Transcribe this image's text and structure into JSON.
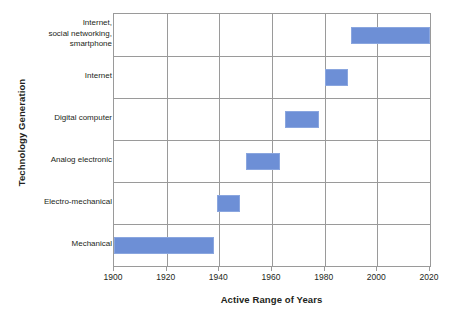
{
  "chart_data": {
    "type": "bar",
    "orientation": "horizontal",
    "subtype": "range-bar",
    "title": "",
    "xlabel": "Active Range of Years",
    "ylabel": "Technology Generation",
    "xlim": [
      1900,
      2020
    ],
    "xticks": [
      1900,
      1920,
      1940,
      1960,
      1980,
      2000,
      2020
    ],
    "xtick_labels": [
      "1900",
      "1920",
      "1940",
      "1960",
      "1980",
      "2000",
      "2020"
    ],
    "grid": true,
    "legend": false,
    "bar_color": "#6d8fd6",
    "bar_edge_color": "#8aa6df",
    "grid_color": "#9a9a9a",
    "categories": [
      "Mechanical",
      "Electro-mechanical",
      "Analog electronic",
      "Digital computer",
      "Internet",
      "Internet,\nsocial networking,\nsmartphone"
    ],
    "bars": [
      {
        "category": "Mechanical",
        "start": 1900,
        "end": 1938
      },
      {
        "category": "Electro-mechanical",
        "start": 1939,
        "end": 1948
      },
      {
        "category": "Analog electronic",
        "start": 1950,
        "end": 1963
      },
      {
        "category": "Digital computer",
        "start": 1965,
        "end": 1978
      },
      {
        "category": "Internet",
        "start": 1980,
        "end": 1989
      },
      {
        "category": "Internet,\nsocial networking,\nsmartphone",
        "start": 1990,
        "end": 2020
      }
    ]
  }
}
